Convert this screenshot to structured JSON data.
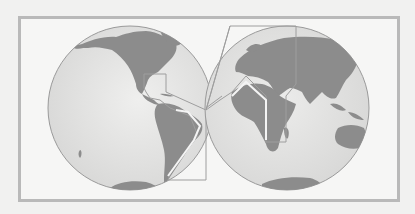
{
  "figure": {
    "type": "two-hemisphere world map",
    "colors": {
      "background": "#f1f1f0",
      "frame_border": "#b9b9b9",
      "ocean": "#d9d9d8",
      "ocean_highlight": "#ebebea",
      "land": "#8c8c8c",
      "globe_outline": "#9a9a9a",
      "route_outline": "#9e9e9e",
      "route_inner": "#f4f4f4"
    },
    "hemispheres": [
      {
        "name": "western-hemisphere",
        "cx": 130,
        "cy": 108,
        "r": 82,
        "features": [
          "North America",
          "Central America",
          "South America",
          "Antarctica"
        ]
      },
      {
        "name": "eastern-hemisphere",
        "cx": 287,
        "cy": 108,
        "r": 82,
        "features": [
          "Europe",
          "Africa",
          "Asia",
          "Australia",
          "Madagascar",
          "Antarctica"
        ]
      }
    ],
    "highlighted_region": "Outlined region linking Caribbean/Central America, eastern South America, West Africa, Europe/Mediterranean and the East African coast"
  }
}
